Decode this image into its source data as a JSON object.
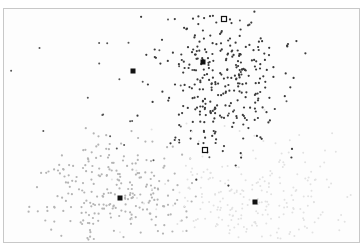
{
  "chart_data": {
    "type": "scatter",
    "title": "",
    "xlabel": "",
    "ylabel": "",
    "grid": false,
    "legend": null,
    "frame": {
      "x": 3,
      "y": 8,
      "width": 357,
      "height": 235
    },
    "clusters": [
      {
        "name": "cluster-north",
        "color": "#3a3a3a",
        "radius": 1.1,
        "count": 320,
        "center": [
          222,
          82
        ],
        "spread": [
          30,
          38
        ],
        "seed": 11
      },
      {
        "name": "cluster-north-scatter",
        "color": "#555555",
        "radius": 1.0,
        "count": 30,
        "center": [
          160,
          80
        ],
        "spread": [
          55,
          35
        ],
        "seed": 23
      },
      {
        "name": "cluster-southwest",
        "color": "#b4b4b4",
        "radius": 1.1,
        "count": 260,
        "center": [
          112,
          195
        ],
        "spread": [
          35,
          28
        ],
        "seed": 37
      },
      {
        "name": "cluster-southeast",
        "color": "#e2e2e2",
        "radius": 1.0,
        "count": 260,
        "center": [
          258,
          195
        ],
        "spread": [
          55,
          30
        ],
        "seed": 53
      }
    ],
    "centroids": [
      {
        "x": 133,
        "y": 71,
        "style": "filled"
      },
      {
        "x": 203,
        "y": 62,
        "style": "filled"
      },
      {
        "x": 120,
        "y": 198,
        "style": "filled"
      },
      {
        "x": 255,
        "y": 202,
        "style": "filled"
      },
      {
        "x": 224,
        "y": 19,
        "style": "hollow"
      },
      {
        "x": 205,
        "y": 150,
        "style": "hollow"
      }
    ],
    "colors": {
      "centroid": "#111111",
      "frame": "#c8c8c8",
      "background": "#fdfdfd"
    }
  }
}
